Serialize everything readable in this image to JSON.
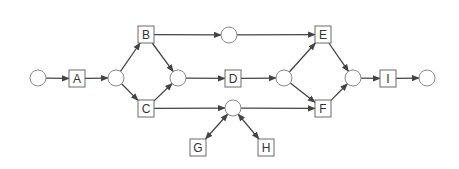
{
  "diagram": {
    "type": "petri-net",
    "colors": {
      "edge": "#444444",
      "place_stroke": "#8a8a8a",
      "transition_stroke": "#6a6a6a",
      "label": "#333333",
      "background": "#ffffff"
    },
    "places": [
      {
        "id": "p_start",
        "cx": 38,
        "cy": 78
      },
      {
        "id": "p1",
        "cx": 116,
        "cy": 78
      },
      {
        "id": "p2",
        "cx": 178,
        "cy": 78
      },
      {
        "id": "p3",
        "cx": 229,
        "cy": 35
      },
      {
        "id": "p4",
        "cx": 284,
        "cy": 78
      },
      {
        "id": "p5",
        "cx": 233,
        "cy": 108
      },
      {
        "id": "p6",
        "cx": 353,
        "cy": 78
      },
      {
        "id": "p_end",
        "cx": 427,
        "cy": 78
      }
    ],
    "transitions": [
      {
        "id": "A",
        "label": "A",
        "x": 69,
        "y": 70
      },
      {
        "id": "B",
        "label": "B",
        "x": 138,
        "y": 26
      },
      {
        "id": "C",
        "label": "C",
        "x": 138,
        "y": 100
      },
      {
        "id": "D",
        "label": "D",
        "x": 225,
        "y": 70
      },
      {
        "id": "E",
        "label": "E",
        "x": 315,
        "y": 26
      },
      {
        "id": "F",
        "label": "F",
        "x": 315,
        "y": 100
      },
      {
        "id": "G",
        "label": "G",
        "x": 190,
        "y": 139
      },
      {
        "id": "H",
        "label": "H",
        "x": 258,
        "y": 139
      },
      {
        "id": "I",
        "label": "I",
        "x": 380,
        "y": 70
      }
    ],
    "arcs": [
      {
        "from": "p_start",
        "to": "A"
      },
      {
        "from": "A",
        "to": "p1"
      },
      {
        "from": "p1",
        "to": "B"
      },
      {
        "from": "p1",
        "to": "C"
      },
      {
        "from": "B",
        "to": "p2"
      },
      {
        "from": "C",
        "to": "p2"
      },
      {
        "from": "B",
        "to": "p3"
      },
      {
        "from": "p3",
        "to": "E"
      },
      {
        "from": "p2",
        "to": "D"
      },
      {
        "from": "D",
        "to": "p4"
      },
      {
        "from": "p4",
        "to": "E"
      },
      {
        "from": "p4",
        "to": "F"
      },
      {
        "from": "C",
        "to": "p5"
      },
      {
        "from": "p5",
        "to": "F"
      },
      {
        "from": "p5",
        "to": "G",
        "bidirectional": true
      },
      {
        "from": "p5",
        "to": "H",
        "bidirectional": true
      },
      {
        "from": "E",
        "to": "p6"
      },
      {
        "from": "F",
        "to": "p6"
      },
      {
        "from": "p6",
        "to": "I"
      },
      {
        "from": "I",
        "to": "p_end"
      }
    ]
  }
}
